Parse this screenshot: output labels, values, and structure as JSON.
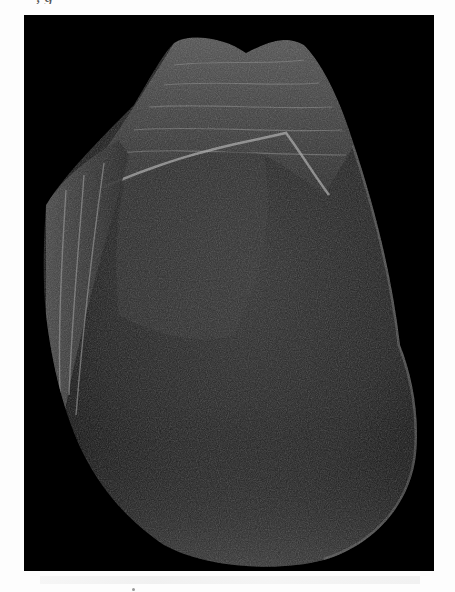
{
  "page": {
    "caption_fragment": ", g",
    "background_color": "#fdfdfd"
  },
  "figure": {
    "background_color": "#000000",
    "stone_base_color": "#2a2a2a",
    "highlight_color": "#9a9a9a",
    "frame": {
      "x": 24,
      "y": 15,
      "width": 410,
      "height": 556
    }
  }
}
